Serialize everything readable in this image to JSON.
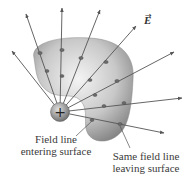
{
  "figure": {
    "vector_label": "E",
    "charge_symbol": "+",
    "labels": {
      "entering_line1": "Field line",
      "entering_line2": "entering surface",
      "leaving_line1": "Same field line",
      "leaving_line2": "leaving surface"
    },
    "colors": {
      "surface_light": "#f2f2f2",
      "surface_dark": "#7a7a7a",
      "field_line": "#555555",
      "text": "#3a3a3a"
    }
  }
}
